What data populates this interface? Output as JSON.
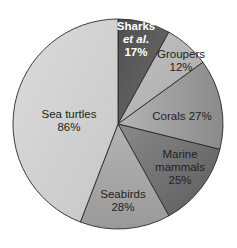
{
  "chart_data": {
    "type": "pie",
    "title": "",
    "note": "Label percentages are independent values (do not sum to 100); slice sizes reflect the drawn angles.",
    "slices": [
      {
        "label": "Sharks et al.",
        "value_label": "17%",
        "value": 17,
        "start_deg": 0,
        "end_deg": 29,
        "color": "#5f5f5f",
        "text_color": "#ffffff"
      },
      {
        "label": "Groupers",
        "value_label": "12%",
        "value": 12,
        "start_deg": 29,
        "end_deg": 54,
        "color": "#b9b9b9",
        "text_color": "#222222"
      },
      {
        "label": "Corals",
        "value_label": "27%",
        "value": 27,
        "start_deg": 54,
        "end_deg": 104,
        "color": "#9c9c9c",
        "text_color": "#222222"
      },
      {
        "label": "Marine mammals",
        "value_label": "25%",
        "value": 25,
        "start_deg": 104,
        "end_deg": 151,
        "color": "#717171",
        "text_color": "#222222"
      },
      {
        "label": "Seabirds",
        "value_label": "28%",
        "value": 28,
        "start_deg": 151,
        "end_deg": 201,
        "color": "#a9a9a9",
        "text_color": "#222222"
      },
      {
        "label": "Sea turtles",
        "value_label": "86%",
        "value": 86,
        "start_deg": 201,
        "end_deg": 360,
        "color": "#d2d2d2",
        "text_color": "#222222"
      }
    ]
  },
  "labels": {
    "sharks_line1": "Sharks",
    "sharks_line2": "et al.",
    "sharks_pct": "17%",
    "groupers_line1": "Groupers",
    "groupers_pct": "12%",
    "corals_line1": "Corals 27%",
    "marine_line1": "Marine",
    "marine_line2": "mammals",
    "marine_pct": "25%",
    "seabirds_line1": "Seabirds",
    "seabirds_pct": "28%",
    "turtles_line1": "Sea turtles",
    "turtles_pct": "86%"
  }
}
